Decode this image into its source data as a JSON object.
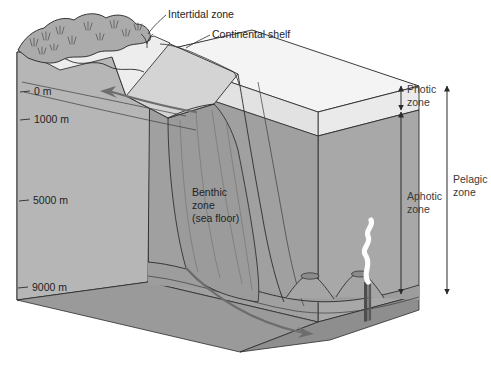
{
  "callouts": {
    "intertidal": "Intertidal zone",
    "continental_shelf": "Continental shelf"
  },
  "depth_scale": {
    "ticks": [
      {
        "label": "0 m",
        "value": 0
      },
      {
        "label": "1000 m",
        "value": 1000
      },
      {
        "label": "5000 m",
        "value": 5000
      },
      {
        "label": "9000 m",
        "value": 9000
      }
    ]
  },
  "zones": {
    "benthic": {
      "line1": "Benthic",
      "line2": "zone",
      "line3": "(sea floor)"
    },
    "photic": {
      "line1": "Photic",
      "line2": "zone"
    },
    "aphotic": {
      "line1": "Aphotic",
      "line2": "zone"
    },
    "pelagic": {
      "line1": "Pelagic",
      "line2": "zone"
    }
  },
  "features": {
    "landmass": "coastal landmass with vegetation",
    "shelf": "continental shelf plateau",
    "slope": "continental slope and submarine canyon",
    "seamounts": "seamounts on abyssal plain",
    "vent": "hydrothermal vent plume",
    "current_upper": "upper ocean current arrow",
    "current_deep": "deep ocean current arrow"
  },
  "colors": {
    "front_face": "#b6b6b6",
    "top_face": "#f2f2f2",
    "photic_slab": "#ededed",
    "shelf": "#d2d2d2",
    "land": "#a9a9a9",
    "beach": "#ececec",
    "deep_water": "#a2a2a2",
    "canyon": "#9a9a9a",
    "side_face": "#cfcfcf",
    "floor_face": "#8f8f8f",
    "outline": "#2b2b2b",
    "plume": "#fbfbfb",
    "current": "#6d6d6d"
  }
}
